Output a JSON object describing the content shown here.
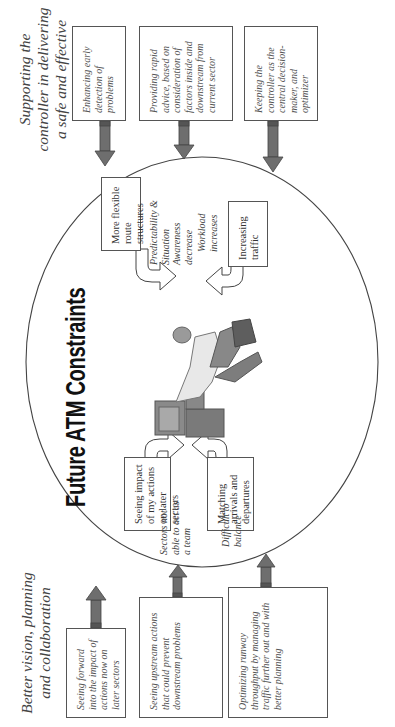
{
  "diagram": {
    "title": "Future ATM Constraints",
    "orientation": "rotated 90 degrees counter-clockwise",
    "left_group": {
      "heading": "Better vision, planning and collaboration",
      "boxes": [
        {
          "text": "Seeing forward into the impact of actions now on later sectors"
        },
        {
          "text": "Seeing upstream actions that could prevent downstream problems"
        },
        {
          "text": "Optimizing runway throughput by managing traffic further out and with better planning"
        }
      ]
    },
    "right_group": {
      "heading": "Supporting the controller in delivering a safe and effective service",
      "boxes": [
        {
          "text": "Enhancing early detection of problems"
        },
        {
          "text": "Providing rapid advice, based on consideration of factors inside and downstream from current sector"
        },
        {
          "text": "Keeping the controller as the central decision-maker, and optimizer"
        }
      ]
    },
    "constraints": [
      {
        "label": "Seeing impact of my actions on later sectors",
        "note": "Sectors not able to act as a team"
      },
      {
        "label": "Matching arrivals and departures",
        "note": "Difficult to balance"
      },
      {
        "label": "More flexible route structures",
        "note": "Predictability & Situation Awareness decrease"
      },
      {
        "label": "Increasing traffic",
        "note": "Workload increases"
      }
    ],
    "colors": {
      "arrow_fill": "#6e6e6e",
      "line": "#444444",
      "box_border": "#555555",
      "background": "#ffffff"
    }
  }
}
